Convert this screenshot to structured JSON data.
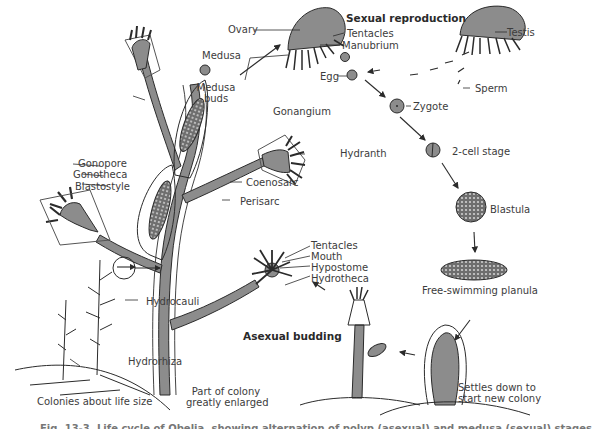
{
  "figure": {
    "section_titles": {
      "sexual": "Sexual reproduction",
      "asexual": "Asexual budding"
    },
    "labels": {
      "ovary": "Ovary",
      "tentacles_medusa": "Tentacles",
      "manubrium": "Manubrium",
      "testis": "Testis",
      "medusa": "Medusa",
      "egg": "Egg",
      "sperm": "Sperm",
      "zygote": "Zygote",
      "medusa_buds_1": "Medusa",
      "medusa_buds_2": "buds",
      "gonangium": "Gonangium",
      "hydranth": "Hydranth",
      "two_cell": "2-cell stage",
      "gonopore": "Gonopore",
      "gonotheca": "Gonotheca",
      "blastostyle": "Blastostyle",
      "coenosarc": "Coenosarc",
      "perisarc": "Perisarc",
      "blastula": "Blastula",
      "tentacles_polyp": "Tentacles",
      "mouth": "Mouth",
      "hypostome": "Hypostome",
      "hydrotheca": "Hydrotheca",
      "free_planula": "Free-swimming planula",
      "hydrocauli": "Hydrocauli",
      "hydrorhiza": "Hydrorhiza",
      "settles_1": "Settles down to",
      "settles_2": "start new colony",
      "colonies_life_size": "Colonies about life size",
      "part_colony_1": "Part of colony",
      "part_colony_2": "greatly enlarged"
    },
    "caption_cropped": "Fig. 13-3. Life cycle of Obelia, showing alternation of polyp (asexual) and medusa (sexual) stages."
  },
  "colors": {
    "tissue": "#8c8c8c",
    "line": "#2b2b2b",
    "background": "#ffffff"
  }
}
